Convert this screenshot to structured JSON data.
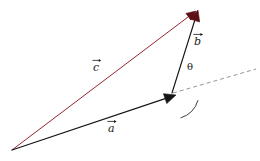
{
  "figure": {
    "name": "vector-addition-triangle",
    "background_color": "#ffffff",
    "width": 260,
    "height": 161
  },
  "colors": {
    "vector_a": "#151515",
    "vector_b": "#151515",
    "vector_c": "#8d1c23",
    "arrowhead_top": "#5c0f14",
    "dashed_line": "#8a8a8a",
    "arc": "#2a2a2a",
    "text": "#1a1a1a"
  },
  "labels": {
    "vector_a": "a",
    "vector_b": "b",
    "vector_c": "c",
    "angle": "θ"
  },
  "geometry": {
    "origin": {
      "x": 12,
      "y": 150
    },
    "vector_a": {
      "name": "a",
      "from": {
        "x": 12,
        "y": 150
      },
      "to": {
        "x": 176,
        "y": 95
      },
      "color": "#151515",
      "arrowhead": "filled-black",
      "style": "solid"
    },
    "vector_b": {
      "name": "b",
      "from": {
        "x": 172,
        "y": 93
      },
      "to": {
        "x": 198,
        "y": 10
      },
      "color": "#151515",
      "arrowhead": "filled-dark-red",
      "style": "solid"
    },
    "vector_c": {
      "name": "c",
      "from": {
        "x": 12,
        "y": 150
      },
      "to": {
        "x": 196,
        "y": 11
      },
      "color": "#8d1c23",
      "arrowhead": "filled-dark-red",
      "style": "solid"
    },
    "dashed_reference_line": {
      "name": "reference-axis",
      "from": {
        "x": 173,
        "y": 93
      },
      "to": {
        "x": 256,
        "y": 69
      },
      "color": "#8a8a8a",
      "style": "dashed"
    },
    "angle_arc": {
      "name": "theta-arc",
      "center": {
        "x": 173,
        "y": 93
      },
      "radius": 26,
      "from_deg": 344,
      "to_deg": 287,
      "color": "#2a2a2a"
    }
  },
  "label_positions": {
    "vector_a": {
      "x": 108,
      "y": 123
    },
    "vector_b": {
      "x": 194,
      "y": 36
    },
    "vector_c": {
      "x": 93,
      "y": 62
    },
    "angle": {
      "x": 187,
      "y": 62
    }
  }
}
